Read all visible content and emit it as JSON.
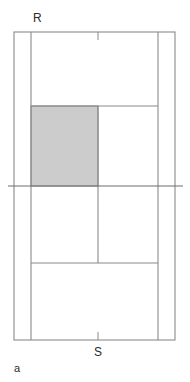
{
  "figure": {
    "panel_label": "a",
    "caption_labels": {
      "top": "R",
      "bottom": "S"
    },
    "colors": {
      "line": "#8a8a8a",
      "line_dark": "#6e6e6e",
      "shaded_fill": "#cccccc",
      "shaded_stroke": "#8a8a8a",
      "text": "#2b2b2b",
      "background": "#ffffff"
    },
    "diagram_type": "tennis-court-plan",
    "orientation": "portrait",
    "geometry": {
      "outer_court": {
        "x": 14,
        "y": 32,
        "width": 161,
        "height": 308
      },
      "singles_left_line_x": 31,
      "singles_right_line_x": 158,
      "center_service_line_x": 98,
      "net_line_y": 186,
      "net_line_x1": 8,
      "net_line_x2": 183,
      "upper_service_line_y": 106,
      "lower_service_line_y": 263,
      "top_baseline_y": 32,
      "bottom_baseline_y": 340,
      "shaded_box": {
        "x": 31,
        "y": 106,
        "width": 67,
        "height": 80
      },
      "top_center_mark": {
        "x": 98,
        "y1": 32,
        "y2": 40
      },
      "bottom_center_mark": {
        "x": 98,
        "y1": 332,
        "y2": 340
      }
    },
    "label_positions": {
      "R": {
        "x": 33,
        "y": 22
      },
      "S": {
        "x": 98,
        "y": 356
      },
      "a": {
        "x": 14,
        "y": 372
      }
    },
    "elements": {
      "outer_boundary_name": "doubles-sideline-boundary",
      "left_singles_name": "left-singles-sideline",
      "right_singles_name": "right-singles-sideline",
      "net_name": "net-line",
      "upper_service_name": "upper-service-line",
      "lower_service_name": "lower-service-line",
      "center_service_name": "center-service-line",
      "shaded_name": "highlighted-service-box"
    }
  }
}
